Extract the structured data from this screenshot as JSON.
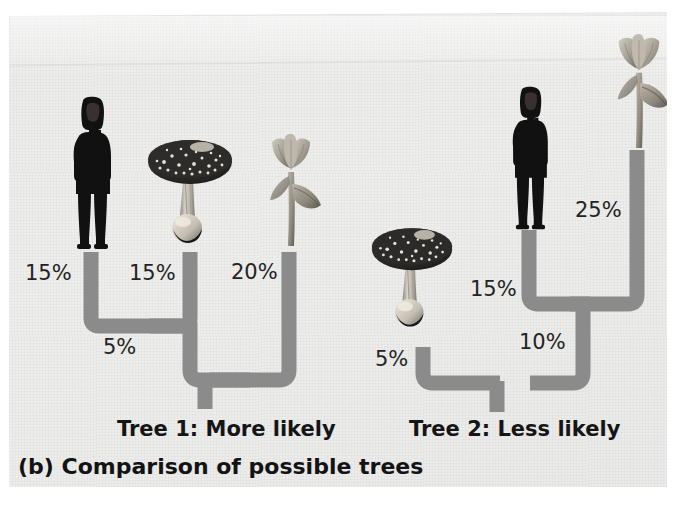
{
  "figure": {
    "label": "(b)",
    "caption": "(b) Comparison of possible trees",
    "background_color": "#ecebea",
    "branch_color": "#8b8b8b",
    "text_color": "#1d1d1d"
  },
  "trees": [
    {
      "id": "tree-1",
      "caption": "Tree 1: More likely",
      "tips": [
        {
          "name": "human",
          "icon": "person-silhouette-icon",
          "branch_label": "15%"
        },
        {
          "name": "mushroom",
          "icon": "mushroom-icon",
          "branch_label": "15%"
        },
        {
          "name": "tulip",
          "icon": "tulip-icon",
          "branch_label": "20%"
        }
      ],
      "internal_branch_label": "5%",
      "topology": "((human,mushroom),tulip)"
    },
    {
      "id": "tree-2",
      "caption": "Tree 2: Less likely",
      "tips": [
        {
          "name": "mushroom",
          "icon": "mushroom-icon",
          "branch_label": "5%"
        },
        {
          "name": "human",
          "icon": "person-silhouette-icon",
          "branch_label": "15%"
        },
        {
          "name": "tulip",
          "icon": "tulip-icon",
          "branch_label": "25%"
        }
      ],
      "internal_branch_label": "10%",
      "topology": "(mushroom,(human,tulip))"
    }
  ],
  "labels": {
    "t1_human_pct": "15%",
    "t1_mushroom_pct": "15%",
    "t1_tulip_pct": "20%",
    "t1_internal_pct": "5%",
    "t2_mushroom_pct": "5%",
    "t2_human_pct": "15%",
    "t2_internal_pct": "10%",
    "t2_tulip_pct": "25%",
    "tree1_caption": "Tree 1: More likely",
    "tree2_caption": "Tree 2: Less likely",
    "figure_caption": "(b) Comparison of possible trees"
  }
}
